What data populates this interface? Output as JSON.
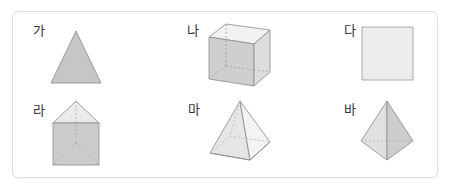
{
  "figures": [
    {
      "id": "ga",
      "label": "가",
      "shape": "triangle"
    },
    {
      "id": "na",
      "label": "나",
      "shape": "cube"
    },
    {
      "id": "da",
      "label": "다",
      "shape": "square"
    },
    {
      "id": "ra",
      "label": "라",
      "shape": "triangular-prism"
    },
    {
      "id": "ma",
      "label": "마",
      "shape": "square-pyramid"
    },
    {
      "id": "ba",
      "label": "바",
      "shape": "triangular-pyramid"
    }
  ],
  "colors": {
    "fill_dark": "#c8c8c8",
    "fill_mid": "#d6d6d6",
    "fill_light": "#ebebeb",
    "stroke": "#8a8a8a",
    "hidden_stroke": "#a8a8a8",
    "border": "#dedede"
  }
}
